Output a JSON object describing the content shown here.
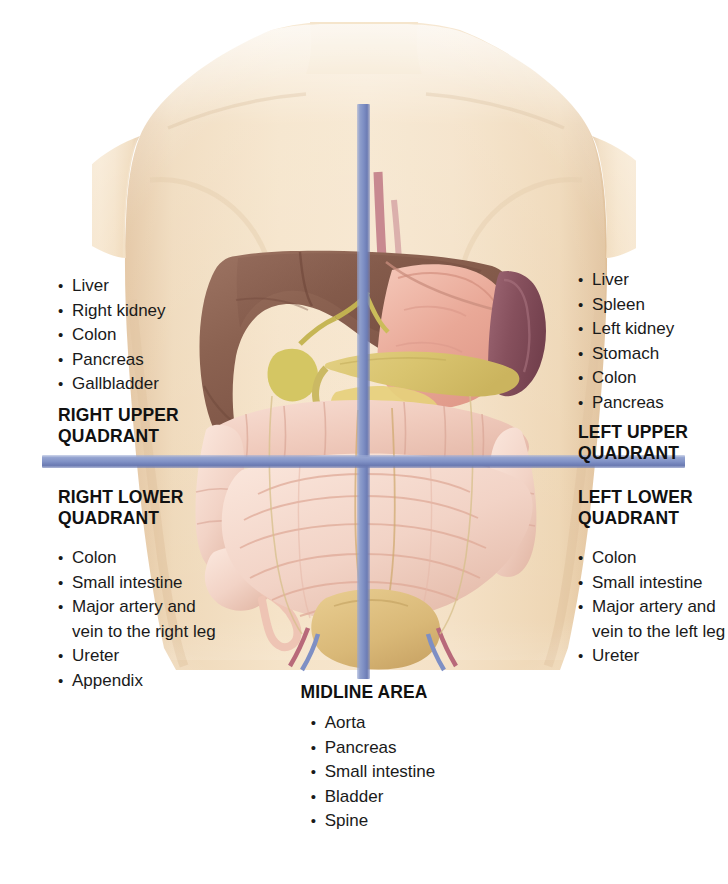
{
  "diagram": {
    "colors": {
      "axis_line": "#8192c6",
      "skin": "#f1dcbe",
      "liver": "#8d6350",
      "stomach": "#e8a99b",
      "spleen": "#8a5560",
      "gallbladder": "#d8cc6a",
      "pancreas": "#ddc878",
      "intestine": "#f0cfc4",
      "bladder": "#d9b877",
      "aorta": "#b8697a",
      "vein": "#7e8fc4",
      "heading_text": "#111111",
      "body_text": "#1a1a1a",
      "background": "#ffffff"
    }
  },
  "quadrants": {
    "right_upper": {
      "heading_line1": "RIGHT UPPER",
      "heading_line2": "QUADRANT",
      "items": [
        "Liver",
        "Right kidney",
        "Colon",
        "Pancreas",
        "Gallbladder"
      ]
    },
    "left_upper": {
      "heading_line1": "LEFT UPPER",
      "heading_line2": "QUADRANT",
      "items": [
        "Liver",
        "Spleen",
        "Left kidney",
        "Stomach",
        "Colon",
        "Pancreas"
      ]
    },
    "right_lower": {
      "heading_line1": "RIGHT LOWER",
      "heading_line2": "QUADRANT",
      "items": [
        "Colon",
        "Small intestine",
        "Major artery and",
        "Ureter",
        "Appendix"
      ],
      "item_3_continuation": "vein to the right leg"
    },
    "left_lower": {
      "heading_line1": "LEFT LOWER",
      "heading_line2": "QUADRANT",
      "items": [
        "Colon",
        "Small intestine",
        "Major artery and",
        "Ureter"
      ],
      "item_3_continuation": "vein to the left leg"
    },
    "midline": {
      "heading": "MIDLINE AREA",
      "items": [
        "Aorta",
        "Pancreas",
        "Small intestine",
        "Bladder",
        "Spine"
      ]
    }
  },
  "bullet": "•"
}
